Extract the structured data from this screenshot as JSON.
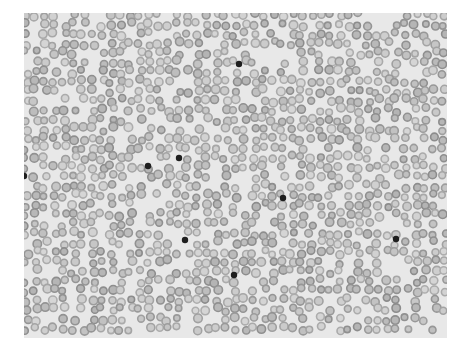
{
  "image": {
    "subject": "Blood smear micrograph showing numerous red blood cells with scattered dark-staining cells",
    "background_color": "#e8e8e8",
    "cell_color": "#9a9a9a",
    "cell_center_color": "#cfcfcf",
    "dark_cell_color": "#1e1e1e"
  },
  "dark_spots": [
    {
      "x": 215,
      "y": 51
    },
    {
      "x": 124,
      "y": 153
    },
    {
      "x": 155,
      "y": 145
    },
    {
      "x": 0,
      "y": 163
    },
    {
      "x": 259,
      "y": 185
    },
    {
      "x": 161,
      "y": 227
    },
    {
      "x": 372,
      "y": 226
    },
    {
      "x": 210,
      "y": 262
    }
  ]
}
